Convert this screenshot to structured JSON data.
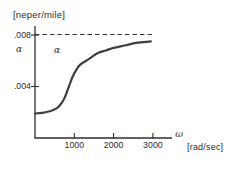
{
  "labels": {
    "unit": "[neper/mile]",
    "alpha_axis": "α",
    "alpha_curve": "α",
    "omega": "ω",
    "x_unit": "[rad/sec]"
  },
  "colors": {
    "ink": "#2e2e2e",
    "curve": "#3f3f3f",
    "asymptote": "#333333",
    "background": "#ffffff"
  },
  "chart_data": {
    "type": "line",
    "title": "[neper/mile]",
    "xlabel": "ω [rad/sec]",
    "ylabel": "α [neper/mile]",
    "xlim": [
      0,
      3500
    ],
    "ylim": [
      0,
      0.0088
    ],
    "x_ticks": [
      1000,
      2000,
      3000
    ],
    "x_tick_labels": [
      "1000",
      "2000",
      "3000"
    ],
    "y_ticks": [
      0.004,
      0.008
    ],
    "y_tick_labels": [
      ".004",
      ".008"
    ],
    "asymptote_y": 0.008,
    "asymptote_style": "dashed",
    "grid": false,
    "legend": "none",
    "series": [
      {
        "name": "alpha-attenuation-curve",
        "x": [
          0,
          250,
          400,
          550,
          650,
          750,
          850,
          950,
          1050,
          1150,
          1300,
          1450,
          1600,
          1800,
          2000,
          2300,
          2600,
          2950
        ],
        "y": [
          0.0019,
          0.002,
          0.0021,
          0.0023,
          0.0026,
          0.0031,
          0.0039,
          0.0047,
          0.0053,
          0.0057,
          0.006,
          0.0063,
          0.0066,
          0.0068,
          0.007,
          0.0072,
          0.0074,
          0.0075
        ]
      }
    ]
  }
}
